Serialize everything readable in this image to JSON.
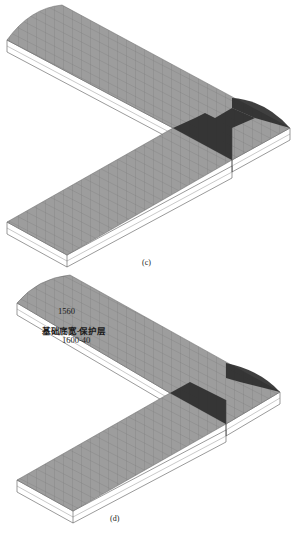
{
  "figure": {
    "panels": [
      {
        "id": "c",
        "caption": "(c)",
        "description": "L-shaped strip footing 3D mesh model with dark intersection zone"
      },
      {
        "id": "d",
        "caption": "(d)",
        "description": "L-shaped strip footing 3D mesh model with width annotation",
        "annotations": {
          "value_label": "1560",
          "formula_label": "基础底宽-保护层",
          "expression_label": "1600-40"
        }
      }
    ]
  },
  "colors": {
    "surface": "#9d9d9d",
    "grid": "#7c7c7c",
    "dark_zone": "#2a2a2a",
    "edge": "#555555",
    "side_face": "#ffffff"
  }
}
